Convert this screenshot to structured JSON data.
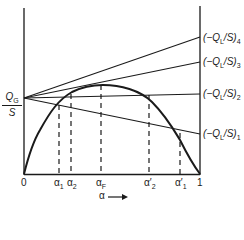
{
  "diagram": {
    "y_axis_label": {
      "numerator": "Q",
      "numerator_sub": "G",
      "denominator": "S"
    },
    "x_axis_label": "α",
    "x_axis_arrow": "→",
    "x_ticks": [
      {
        "text": "0",
        "sub": ""
      },
      {
        "text": "α",
        "sub": "1"
      },
      {
        "text": "α",
        "sub": "2"
      },
      {
        "text": "α",
        "sub": "F"
      },
      {
        "text": "α′",
        "sub": "2"
      },
      {
        "text": "α′",
        "sub": "1"
      },
      {
        "text": "1",
        "sub": ""
      }
    ],
    "lines": [
      {
        "label": "(−Q",
        "sub": "L",
        "rest": "/S)",
        "index": "4"
      },
      {
        "label": "(−Q",
        "sub": "L",
        "rest": "/S)",
        "index": "3"
      },
      {
        "label": "(−Q",
        "sub": "L",
        "rest": "/S)",
        "index": "2"
      },
      {
        "label": "(−Q",
        "sub": "L",
        "rest": "/S)",
        "index": "1"
      }
    ]
  }
}
